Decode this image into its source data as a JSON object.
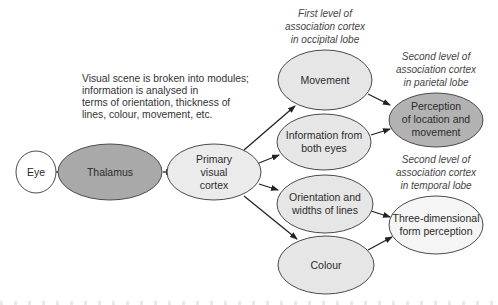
{
  "intro_text": {
    "lines": [
      "Visual scene is broken into modules;",
      "information is analysed in",
      "terms of orientation, thickness of",
      "lines, colour, movement, etc."
    ]
  },
  "annotations": {
    "first_level": [
      "First level of",
      "association cortex",
      "in occipital lobe"
    ],
    "second_parietal": [
      "Second level of",
      "association cortex",
      "in parietal lobe"
    ],
    "second_temporal": [
      "Second level of",
      "association cortex",
      "in temporal lobe"
    ]
  },
  "nodes": {
    "eye": {
      "lines": [
        "Eye"
      ],
      "fill": "#ffffff"
    },
    "thalamus": {
      "lines": [
        "Thalamus"
      ],
      "fill": "#a9a9a9"
    },
    "primary": {
      "lines": [
        "Primary",
        "visual",
        "cortex"
      ],
      "fill": "#ebebeb"
    },
    "movement": {
      "lines": [
        "Movement"
      ],
      "fill": "#e6e6e6"
    },
    "both_eyes": {
      "lines": [
        "Information from",
        "both eyes"
      ],
      "fill": "#e6e6e6"
    },
    "orientation": {
      "lines": [
        "Orientation and",
        "widths of lines"
      ],
      "fill": "#e6e6e6"
    },
    "colour": {
      "lines": [
        "Colour"
      ],
      "fill": "#e6e6e6"
    },
    "perception": {
      "lines": [
        "Perception",
        "of location and",
        "movement"
      ],
      "fill": "#b2b2b2"
    },
    "three_d": {
      "lines": [
        "Three-dimensional",
        "form perception"
      ],
      "fill": "#f5f5f5"
    }
  },
  "edges": [
    [
      "eye",
      "thalamus"
    ],
    [
      "thalamus",
      "primary"
    ],
    [
      "primary",
      "movement"
    ],
    [
      "primary",
      "both_eyes"
    ],
    [
      "primary",
      "orientation"
    ],
    [
      "primary",
      "colour"
    ],
    [
      "movement",
      "perception"
    ],
    [
      "both_eyes",
      "perception"
    ],
    [
      "orientation",
      "three_d"
    ],
    [
      "colour",
      "three_d"
    ]
  ],
  "colors": {
    "stroke": "#4a4a4a",
    "arrow": "#222222"
  }
}
